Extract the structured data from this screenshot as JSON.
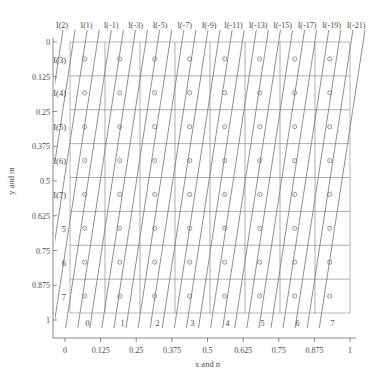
{
  "chart_data": {
    "type": "line",
    "title": "",
    "xlabel": "x and n",
    "ylabel": "y and m",
    "xlim": [
      0,
      1
    ],
    "ylim": [
      0,
      1
    ],
    "grid": true,
    "legend": "none",
    "x_tick_labels": [
      "0",
      "0.125",
      "0.25",
      "0.375",
      "0.5",
      "0.625",
      "0.75",
      "0.875",
      "1"
    ],
    "x_tick_values": [
      0,
      0.125,
      0.25,
      0.375,
      0.5,
      0.625,
      0.75,
      0.875,
      1
    ],
    "y_tick_labels": [
      "0",
      "0.125",
      "0.25",
      "0.375",
      "0.5",
      "0.625",
      "0.75",
      "0.875",
      "1"
    ],
    "y_tick_values": [
      0,
      0.125,
      0.25,
      0.375,
      0.5,
      0.625,
      0.75,
      0.875,
      1
    ],
    "inner_x_tick_labels": [
      "0",
      "1",
      "2",
      "3",
      "4",
      "5",
      "6",
      "7"
    ],
    "inner_y_tick_labels": [
      "I(3)",
      "I(4)",
      "I(5)",
      "I(6)",
      "I(7)",
      "5",
      "6",
      "7"
    ],
    "top_diagonal_labels": [
      "I(2)",
      "I(1)",
      "I(-1)",
      "I(-3)",
      "I(-5)",
      "I(-7)",
      "I(-9)",
      "I(-11)",
      "I(-13)",
      "I(-15)",
      "I(-17)",
      "I(-19)",
      "I(-21)"
    ],
    "diagonal_count": 26,
    "diagonal_slope_dx": 0.0555,
    "marker": "circle",
    "marker_rows": 8,
    "marker_cols": 8,
    "series": [
      {
        "name": "grid-m-rows",
        "values": [
          0,
          0.125,
          0.25,
          0.375,
          0.5,
          0.625,
          0.75,
          0.875,
          1
        ]
      },
      {
        "name": "grid-n-cols",
        "values": [
          0,
          0.125,
          0.25,
          0.375,
          0.5,
          0.625,
          0.75,
          0.875,
          1
        ]
      }
    ]
  },
  "colors": {
    "line": "#6b6b6b",
    "grid": "#8a8a8a",
    "frame": "#9a9a9a",
    "axis": "#6a6a6a",
    "text": "#4a4a4a",
    "background": "#ffffff"
  }
}
